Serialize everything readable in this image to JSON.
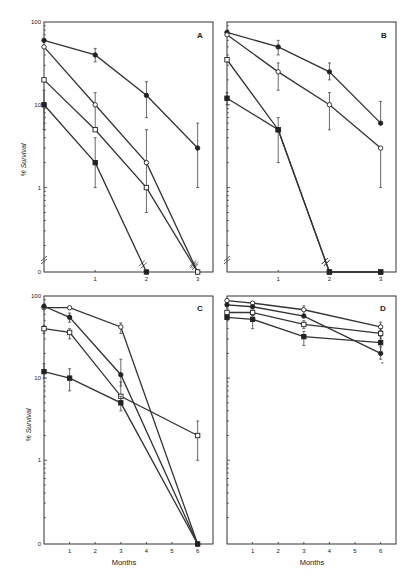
{
  "figure": {
    "ylabel": "% Survival",
    "xlabel": "Months",
    "y_tick_labels": [
      "100",
      "10",
      "1",
      "0"
    ],
    "stray_mark": "*"
  },
  "chart_data": [
    {
      "panel": "A",
      "type": "line",
      "yscale": "log",
      "ylim": [
        0,
        100
      ],
      "xlim": [
        0,
        3.3
      ],
      "x_ticks": [
        "1",
        "2",
        "3"
      ],
      "xlabel": "",
      "ylabel": "% Survival",
      "axis_break": true,
      "series": [
        {
          "name": "filled circle",
          "marker": "filled-circle",
          "x": [
            0,
            1,
            2,
            3
          ],
          "y": [
            60,
            40,
            13,
            3
          ],
          "err_low": [
            null,
            33,
            7,
            1
          ],
          "err_high": [
            null,
            48,
            19,
            6
          ]
        },
        {
          "name": "open circle",
          "marker": "open-circle",
          "x": [
            0,
            1,
            2,
            3
          ],
          "y": [
            50,
            10,
            2,
            0
          ],
          "err_low": [
            null,
            5,
            0.5,
            null
          ],
          "err_high": [
            null,
            14,
            5,
            null
          ]
        },
        {
          "name": "open square",
          "marker": "open-square",
          "x": [
            0,
            1,
            2,
            3
          ],
          "y": [
            20,
            5,
            1,
            0
          ],
          "err_low": [
            null,
            5,
            1,
            null
          ],
          "err_high": [
            null,
            5,
            1,
            null
          ]
        },
        {
          "name": "filled square",
          "marker": "filled-square",
          "x": [
            0,
            1,
            2
          ],
          "y": [
            10,
            2,
            0
          ],
          "err_low": [
            5,
            1,
            null
          ],
          "err_high": [
            15,
            4,
            null
          ]
        }
      ]
    },
    {
      "panel": "B",
      "type": "line",
      "yscale": "log",
      "ylim": [
        0,
        100
      ],
      "xlim": [
        0,
        3.3
      ],
      "x_ticks": [
        "1",
        "2",
        "3"
      ],
      "xlabel": "",
      "axis_break": true,
      "series": [
        {
          "name": "filled circle",
          "marker": "filled-circle",
          "x": [
            0,
            1,
            2,
            3
          ],
          "y": [
            75,
            50,
            25,
            6
          ],
          "err_low": [
            null,
            40,
            20,
            6
          ],
          "err_high": [
            null,
            60,
            32,
            11
          ]
        },
        {
          "name": "open circle",
          "marker": "open-circle",
          "x": [
            0,
            1,
            2,
            3
          ],
          "y": [
            70,
            25,
            10,
            3
          ],
          "err_low": [
            null,
            15,
            5,
            1
          ],
          "err_high": [
            null,
            32,
            14,
            3
          ]
        },
        {
          "name": "open square",
          "marker": "open-square",
          "x": [
            0,
            1,
            2,
            3
          ],
          "y": [
            35,
            5,
            0,
            0
          ],
          "err_low": [
            null,
            2,
            null,
            null
          ],
          "err_high": [
            null,
            7,
            null,
            null
          ]
        },
        {
          "name": "filled square",
          "marker": "filled-square",
          "x": [
            0,
            1,
            2,
            3
          ],
          "y": [
            12,
            5,
            0,
            0
          ],
          "err_low": [
            10,
            5,
            null,
            null
          ],
          "err_high": [
            14,
            5,
            null,
            null
          ]
        }
      ]
    },
    {
      "panel": "C",
      "type": "line",
      "yscale": "log",
      "ylim": [
        0,
        100
      ],
      "xlim": [
        0,
        6.6
      ],
      "x_ticks": [
        "1",
        "2",
        "3",
        "4",
        "5",
        "6"
      ],
      "xlabel": "Months",
      "ylabel": "% Survival",
      "series": [
        {
          "name": "open circle",
          "marker": "open-circle",
          "x": [
            0,
            1,
            3,
            6
          ],
          "y": [
            72,
            72,
            42,
            0
          ],
          "err_low": [
            null,
            null,
            35,
            null
          ],
          "err_high": [
            null,
            null,
            47,
            null
          ]
        },
        {
          "name": "filled circle",
          "marker": "filled-circle",
          "x": [
            0,
            1,
            3,
            6
          ],
          "y": [
            75,
            55,
            11,
            0
          ],
          "err_low": [
            null,
            48,
            8,
            null
          ],
          "err_high": [
            null,
            62,
            17,
            null
          ]
        },
        {
          "name": "open square",
          "marker": "open-square",
          "x": [
            0,
            1,
            3,
            6
          ],
          "y": [
            40,
            36,
            6,
            2
          ],
          "err_low": [
            35,
            30,
            5,
            1
          ],
          "err_high": [
            44,
            40,
            9,
            3
          ]
        },
        {
          "name": "filled square",
          "marker": "filled-square",
          "x": [
            0,
            1,
            3,
            6
          ],
          "y": [
            12,
            10,
            5,
            0
          ],
          "err_low": [
            10,
            7,
            4,
            null
          ],
          "err_high": [
            15,
            13,
            6,
            null
          ]
        }
      ]
    },
    {
      "panel": "D",
      "type": "line",
      "yscale": "log",
      "ylim": [
        0,
        100
      ],
      "xlim": [
        0,
        6.6
      ],
      "x_ticks": [
        "1",
        "2",
        "3",
        "4",
        "5",
        "6"
      ],
      "xlabel": "Months",
      "series": [
        {
          "name": "open circle",
          "marker": "open-circle",
          "x": [
            0,
            1,
            3,
            6
          ],
          "y": [
            88,
            82,
            68,
            42
          ],
          "err_low": [
            null,
            null,
            60,
            38
          ],
          "err_high": [
            null,
            null,
            76,
            48
          ]
        },
        {
          "name": "filled circle",
          "marker": "filled-circle",
          "x": [
            0,
            1,
            3,
            6
          ],
          "y": [
            78,
            74,
            57,
            20
          ],
          "err_low": [
            null,
            null,
            null,
            17
          ],
          "err_high": [
            null,
            null,
            null,
            24
          ]
        },
        {
          "name": "open square",
          "marker": "open-square",
          "x": [
            0,
            1,
            3,
            6
          ],
          "y": [
            63,
            63,
            45,
            35
          ],
          "err_low": [
            null,
            58,
            40,
            30
          ],
          "err_high": [
            null,
            67,
            50,
            40
          ]
        },
        {
          "name": "filled square",
          "marker": "filled-square",
          "x": [
            0,
            1,
            3,
            6
          ],
          "y": [
            55,
            52,
            32,
            27
          ],
          "err_low": [
            null,
            40,
            25,
            21
          ],
          "err_high": [
            null,
            58,
            37,
            32
          ]
        }
      ]
    }
  ]
}
